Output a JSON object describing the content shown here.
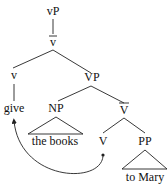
{
  "diagram": {
    "type": "syntax-tree",
    "nodes": {
      "vP": "vP",
      "v_bar": "v",
      "v": "v",
      "VP": "VP",
      "NP": "NP",
      "V_bar": "V",
      "V": "V",
      "PP": "PP"
    },
    "leaves": {
      "give": "give",
      "the_books": "the books",
      "to_Mary": "to Mary"
    },
    "movement": {
      "from": "V",
      "to": "give",
      "description": "head movement of V to v"
    },
    "colors": {
      "line": "#222222",
      "text": "#111111",
      "background": "#ffffff"
    }
  }
}
